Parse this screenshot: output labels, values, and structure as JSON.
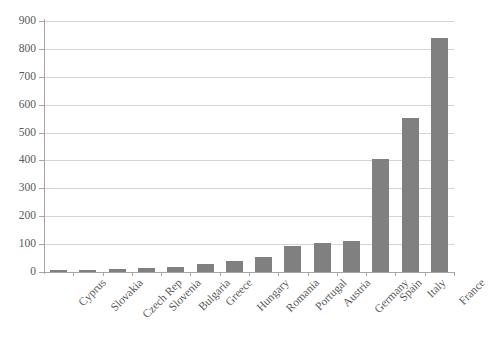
{
  "chart_data": {
    "type": "bar",
    "title": "",
    "subtitle": "",
    "xlabel": "",
    "ylabel": "",
    "categories": [
      "Cyprus",
      "Slovakia",
      "Czech Rep",
      "Slovenia",
      "Bulgaria",
      "Greece",
      "Hungary",
      "Romania",
      "Portugal",
      "Austria",
      "Germany",
      "Spain",
      "Italy",
      "France"
    ],
    "values": [
      7,
      9,
      11,
      15,
      19,
      29,
      40,
      54,
      95,
      104,
      110,
      405,
      554,
      839
    ],
    "ylim": [
      0,
      900
    ],
    "ytick_step": 100,
    "ytick_labels": [
      "0",
      "100",
      "200",
      "300",
      "400",
      "500",
      "600",
      "700",
      "800",
      "900"
    ],
    "grid": true,
    "grid_axis": "y",
    "legend": false,
    "legend_position": "none",
    "bar_color": "#808080",
    "gridline_color": "#d4d4d4",
    "axis_color": "#a6a6a6",
    "text_color": "#595959",
    "background_color": "#ffffff",
    "xtick_label_rotation": -45
  }
}
